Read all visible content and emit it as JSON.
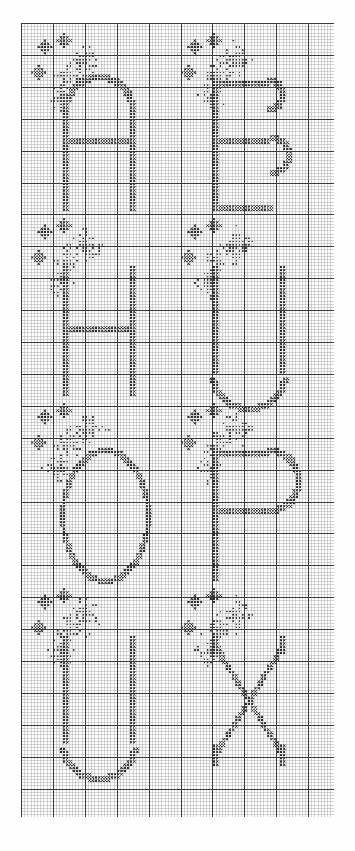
{
  "document": {
    "type": "cross-stitch-pattern-chart",
    "title": "Alphabet Cross Stitch Chart",
    "description": "Monochrome counted cross-stitch grid chart showing eight capital letters with sparkle/star accent motifs",
    "background_color": "#fefefe",
    "page_width": 355,
    "page_height": 851
  },
  "grid": {
    "origin_x": 21,
    "origin_y": 23,
    "cell_size": 3.19,
    "cols": 98,
    "rows": 249,
    "minor_line_color": "#8e8e8e",
    "major_line_color": "#3a3a3a",
    "major_every": 10,
    "minor_line_width": 0.5,
    "major_line_width": 1.0,
    "show_minor": true,
    "show_major": true
  },
  "symbols": {
    "full_stitch": {
      "name": "cross-stitch-x",
      "glyph": "X",
      "color": "#2b2b2b",
      "description": "solid X cross stitch"
    },
    "dot_stitch": {
      "name": "dot-stitch",
      "glyph": "•",
      "color": "#3c3c3c",
      "description": "small filled square / dot stitch"
    },
    "empty": {
      "name": "empty-cell",
      "glyph": "",
      "color": "#ffffff",
      "description": "unstitched cell"
    }
  },
  "chart_data": {
    "type": "heatmap",
    "title": "Alphabet Cross Stitch Chart",
    "xlabel": "",
    "ylabel": "",
    "grid": true,
    "legend_position": "none",
    "cols": 98,
    "rows": 249,
    "cell_values": [
      "empty",
      "dot",
      "full"
    ],
    "letters": [
      {
        "char": "A",
        "row": 0,
        "col": 0,
        "origin_col": 13,
        "origin_row": 18,
        "width": 24,
        "height": 40,
        "style": "rounded-arch",
        "accent": "sparkle-cluster-left"
      },
      {
        "char": "B",
        "row": 0,
        "col": 1,
        "origin_col": 60,
        "origin_row": 18,
        "width": 24,
        "height": 40,
        "style": "double-bowl",
        "accent": "sparkle-cluster-left"
      },
      {
        "char": "H",
        "row": 1,
        "col": 0,
        "origin_col": 13,
        "origin_row": 76,
        "width": 24,
        "height": 40,
        "style": "serif-bars",
        "accent": "sparkle-cluster-left"
      },
      {
        "char": "U",
        "row": 1,
        "col": 1,
        "origin_col": 60,
        "origin_row": 76,
        "width": 24,
        "height": 40,
        "style": "rounded-bowl",
        "accent": "sparkle-cluster-left"
      },
      {
        "char": "O",
        "row": 2,
        "col": 0,
        "origin_col": 13,
        "origin_row": 134,
        "width": 26,
        "height": 40,
        "style": "rounded-oval",
        "accent": "sparkle-cluster-left"
      },
      {
        "char": "P",
        "row": 2,
        "col": 1,
        "origin_col": 60,
        "origin_row": 134,
        "width": 24,
        "height": 40,
        "style": "single-bowl",
        "accent": "sparkle-cluster-left"
      },
      {
        "char": "U",
        "row": 3,
        "col": 0,
        "origin_col": 13,
        "origin_row": 192,
        "width": 24,
        "height": 40,
        "style": "rounded-bowl",
        "accent": "sparkle-cluster-left"
      },
      {
        "char": "X",
        "row": 3,
        "col": 1,
        "origin_col": 60,
        "origin_row": 192,
        "width": 24,
        "height": 40,
        "style": "crossed-diagonals",
        "accent": "sparkle-cluster-left"
      }
    ],
    "motifs": {
      "star": {
        "name": "four-point-star",
        "size": 5,
        "count_per_letter": 3
      },
      "burst": {
        "name": "dotted-starburst",
        "description": "diamond spray of dot stitches above and left of each letter"
      }
    },
    "rows_layout": [
      {
        "index": 0,
        "letters": [
          "A",
          "B"
        ],
        "top_row": 8
      },
      {
        "index": 1,
        "letters": [
          "H",
          "U"
        ],
        "top_row": 66
      },
      {
        "index": 2,
        "letters": [
          "O",
          "P"
        ],
        "top_row": 124
      },
      {
        "index": 3,
        "letters": [
          "U",
          "X"
        ],
        "top_row": 182
      }
    ]
  }
}
